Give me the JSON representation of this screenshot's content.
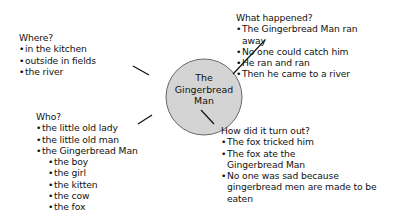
{
  "center": {
    "label_lines": [
      "The",
      "Gingerbread",
      "Man"
    ],
    "fill": "#d4d4d4"
  },
  "where": {
    "heading": "Where?",
    "items": [
      "in the kitchen",
      "outside in fields",
      "the river"
    ]
  },
  "what_happened": {
    "heading": "What happened?",
    "items": [
      "The Gingerbread Man ran away",
      "No one could catch him",
      "He ran and ran",
      "Then he came to a river"
    ]
  },
  "who": {
    "heading": "Who?",
    "items": [
      "the little old lady",
      "the little old man",
      "the Gingerbread Man"
    ],
    "sub_items": [
      "the boy",
      "the girl",
      "the kitten",
      "the cow",
      "the fox"
    ]
  },
  "outcome": {
    "heading": "How did it turn out?",
    "items": [
      "The fox tricked him",
      "The fox ate the Gingerbread Man",
      "No one was sad because gingerbread men are made to be eaten"
    ]
  }
}
